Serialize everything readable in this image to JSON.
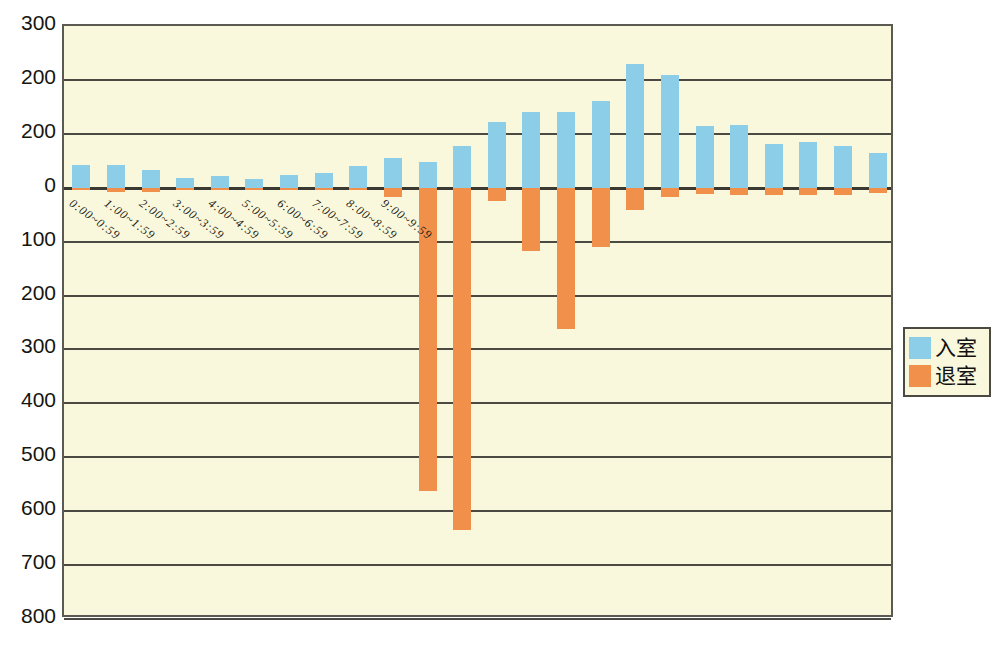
{
  "chart_data": {
    "type": "bar",
    "title": "",
    "subtitle": "",
    "xlabel": "",
    "ylabel": "",
    "orientation": "vertical",
    "grid": true,
    "legend_position": "right",
    "ylim": [
      -800,
      300
    ],
    "ytick_step": 100,
    "ytick_labels": [
      "300",
      "200",
      "200",
      "0",
      "100",
      "200",
      "300",
      "400",
      "500",
      "600",
      "700",
      "800"
    ],
    "ytick_values": [
      300,
      200,
      100,
      0,
      -100,
      -200,
      -300,
      -400,
      -500,
      -600,
      -700,
      -800
    ],
    "categories": [
      "0:00~0:59",
      "1:00~1:59",
      "2:00~2:59",
      "3:00~3:59",
      "4:00~4:59",
      "5:00~5:59",
      "6:00~6:59",
      "7:00~7:59",
      "8:00~8:59",
      "9:00~9:59",
      "10:00~10:59",
      "11:00~11:59",
      "12:00~12:59",
      "13:00~13:59",
      "14:00~14:59",
      "15:00~15:59",
      "16:00~16:59",
      "17:00~17:59",
      "18:00~18:59",
      "19:00~19:59",
      "20:00~20:59",
      "21:00~21:59",
      "22:00~22:59",
      "23:00~23:59"
    ],
    "visible_categories": [
      "0:00~0:59",
      "1:00~1:59",
      "2:00~2:59",
      "3:00~3:59",
      "4:00~4:59",
      "5:00~5:59",
      "6:00~6:59",
      "7:00~7:59",
      "8:00~8:59",
      "9:00~9:59"
    ],
    "series": [
      {
        "name": "入室",
        "color": "#8ccee8",
        "values": [
          42,
          42,
          33,
          18,
          22,
          17,
          23,
          28,
          40,
          55,
          48,
          78,
          122,
          140,
          140,
          160,
          230,
          210,
          115,
          117,
          82,
          85,
          77,
          65
        ]
      },
      {
        "name": "退室",
        "color": "#f0904a",
        "values": [
          -5,
          -8,
          -8,
          -3,
          -3,
          -3,
          -3,
          -3,
          -3,
          -18,
          -562,
          -635,
          -25,
          -118,
          -262,
          -110,
          -42,
          -18,
          -12,
          -14,
          -14,
          -14,
          -14,
          -10
        ]
      }
    ]
  },
  "legend": {
    "entries": [
      {
        "label": "入室",
        "color": "#8ccee8",
        "swatch_name": "legend-swatch-entry"
      },
      {
        "label": "退室",
        "color": "#f0904a",
        "swatch_name": "legend-swatch-exit"
      }
    ]
  }
}
